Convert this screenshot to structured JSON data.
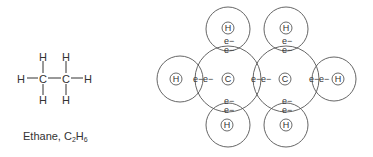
{
  "structural_formula": {
    "caption_name": "Ethane,",
    "caption_formula": {
      "c": "C",
      "c_sub": "2",
      "h": "H",
      "h_sub": "6"
    },
    "atoms": [
      {
        "id": "h-top-left",
        "label": "H",
        "x": 43,
        "y": 57
      },
      {
        "id": "h-top-right",
        "label": "H",
        "x": 66,
        "y": 57
      },
      {
        "id": "h-left",
        "label": "H",
        "x": 21,
        "y": 79
      },
      {
        "id": "c-left",
        "label": "C",
        "x": 43,
        "y": 79
      },
      {
        "id": "c-right",
        "label": "C",
        "x": 66,
        "y": 79
      },
      {
        "id": "h-right",
        "label": "H",
        "x": 88,
        "y": 79
      },
      {
        "id": "h-bottom-left",
        "label": "H",
        "x": 43,
        "y": 100
      },
      {
        "id": "h-bottom-right",
        "label": "H",
        "x": 66,
        "y": 100
      }
    ],
    "bonds": [
      {
        "x1": 27,
        "y1": 78,
        "x2": 38,
        "y2": 78
      },
      {
        "x1": 48,
        "y1": 78,
        "x2": 61,
        "y2": 78
      },
      {
        "x1": 71,
        "y1": 78,
        "x2": 83,
        "y2": 78
      },
      {
        "x1": 43,
        "y1": 61,
        "x2": 43,
        "y2": 73
      },
      {
        "x1": 66,
        "y1": 61,
        "x2": 66,
        "y2": 73
      },
      {
        "x1": 43,
        "y1": 84,
        "x2": 43,
        "y2": 95
      },
      {
        "x1": 66,
        "y1": 84,
        "x2": 66,
        "y2": 95
      }
    ]
  },
  "orbital_diagram": {
    "shells": [
      {
        "id": "carbon-left-shell",
        "cx": 228,
        "cy": 79,
        "r": 33
      },
      {
        "id": "carbon-right-shell",
        "cx": 286,
        "cy": 79,
        "r": 33
      },
      {
        "id": "hydrogen-left-shell",
        "cx": 180,
        "cy": 79,
        "r": 23
      },
      {
        "id": "hydrogen-right-shell",
        "cx": 334,
        "cy": 79,
        "r": 22
      },
      {
        "id": "hydrogen-top-left-shell",
        "cx": 228,
        "cy": 29,
        "r": 22
      },
      {
        "id": "hydrogen-top-right-shell",
        "cx": 286,
        "cy": 29,
        "r": 22
      },
      {
        "id": "hydrogen-bottom-left-shell",
        "cx": 228,
        "cy": 125,
        "r": 22
      },
      {
        "id": "hydrogen-bottom-right-shell",
        "cx": 286,
        "cy": 125,
        "r": 22
      }
    ],
    "nuclei": [
      {
        "id": "carbon-left-nucleus",
        "label": "C",
        "cx": 228,
        "cy": 79
      },
      {
        "id": "carbon-right-nucleus",
        "label": "C",
        "cx": 285,
        "cy": 79
      },
      {
        "id": "hydrogen-left-nucleus",
        "label": "H",
        "cx": 176,
        "cy": 79
      },
      {
        "id": "hydrogen-right-nucleus",
        "label": "H",
        "cx": 338,
        "cy": 79
      },
      {
        "id": "hydrogen-top-left-nucleus",
        "label": "H",
        "cx": 228,
        "cy": 28
      },
      {
        "id": "hydrogen-top-right-nucleus",
        "label": "H",
        "cx": 286,
        "cy": 28
      },
      {
        "id": "hydrogen-bottom-left-nucleus",
        "label": "H",
        "cx": 227,
        "cy": 125
      },
      {
        "id": "hydrogen-bottom-right-nucleus",
        "label": "H",
        "cx": 286,
        "cy": 125
      }
    ],
    "electrons": [
      {
        "label": "e−",
        "x": 193,
        "y": 82
      },
      {
        "label": "e−",
        "x": 203,
        "y": 82
      },
      {
        "label": "e−",
        "x": 251,
        "y": 82
      },
      {
        "label": "e−",
        "x": 261,
        "y": 82
      },
      {
        "label": "e−",
        "x": 309,
        "y": 82
      },
      {
        "label": "e−",
        "x": 319,
        "y": 82
      },
      {
        "label": "e−",
        "x": 224,
        "y": 44
      },
      {
        "label": "e−",
        "x": 224,
        "y": 53
      },
      {
        "label": "e−",
        "x": 282,
        "y": 44
      },
      {
        "label": "e−",
        "x": 282,
        "y": 53
      },
      {
        "label": "e−",
        "x": 224,
        "y": 104
      },
      {
        "label": "e−",
        "x": 224,
        "y": 113
      },
      {
        "label": "e−",
        "x": 282,
        "y": 104
      },
      {
        "label": "e−",
        "x": 282,
        "y": 113
      }
    ]
  }
}
